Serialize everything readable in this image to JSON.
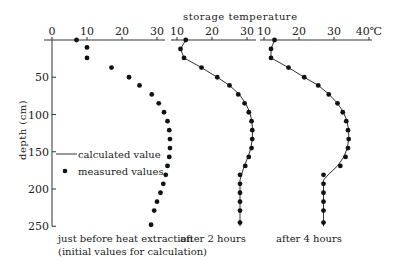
{
  "chart_data": {
    "type": "line",
    "title": "",
    "xlabel": "storage temperature",
    "x_unit": "℃",
    "ylabel": "depth (cm)",
    "ylim": [
      0,
      250
    ],
    "yticks": [
      50,
      100,
      150,
      200,
      250
    ],
    "ytick_labels": [
      "50",
      "100",
      "150",
      "200",
      "250"
    ],
    "grid": false,
    "legend": {
      "position": "left-middle",
      "entries": [
        {
          "label": "calculated value",
          "marker": "line"
        },
        {
          "label": "measured values",
          "marker": "dot"
        }
      ]
    },
    "panels": [
      {
        "caption_lines": [
          "just before heat extraction",
          "(initial values for calculation)"
        ],
        "xlim": [
          0,
          30
        ],
        "xticks": [
          0,
          10,
          20,
          30
        ],
        "xtick_labels": [
          "0",
          "10",
          "20",
          "30"
        ],
        "measured": [
          {
            "t": 7,
            "d": 0
          },
          {
            "t": 10,
            "d": 10
          },
          {
            "t": 10,
            "d": 24
          },
          {
            "t": 17,
            "d": 37
          },
          {
            "t": 22,
            "d": 50
          },
          {
            "t": 25,
            "d": 61
          },
          {
            "t": 28.5,
            "d": 73
          },
          {
            "t": 30.5,
            "d": 85
          },
          {
            "t": 32,
            "d": 97
          },
          {
            "t": 33,
            "d": 109
          },
          {
            "t": 33.5,
            "d": 121
          },
          {
            "t": 33.7,
            "d": 133
          },
          {
            "t": 33.7,
            "d": 145
          },
          {
            "t": 33.5,
            "d": 157
          },
          {
            "t": 33,
            "d": 169
          },
          {
            "t": 32.5,
            "d": 181
          },
          {
            "t": 31.8,
            "d": 193
          },
          {
            "t": 31,
            "d": 205
          },
          {
            "t": 30,
            "d": 217
          },
          {
            "t": 29.2,
            "d": 229
          },
          {
            "t": 28.3,
            "d": 248
          }
        ],
        "calculated": []
      },
      {
        "caption_lines": [
          "after 2 hours"
        ],
        "xlim": [
          10,
          30
        ],
        "xticks": [
          10,
          20,
          30
        ],
        "xtick_labels": [
          "10",
          "20",
          "30"
        ],
        "measured": [
          {
            "t": 12.5,
            "d": 0
          },
          {
            "t": 11,
            "d": 12
          },
          {
            "t": 12,
            "d": 24
          },
          {
            "t": 17,
            "d": 37
          },
          {
            "t": 21.5,
            "d": 50
          },
          {
            "t": 25,
            "d": 61
          },
          {
            "t": 27.5,
            "d": 73
          },
          {
            "t": 29.3,
            "d": 85
          },
          {
            "t": 30.5,
            "d": 97
          },
          {
            "t": 31.3,
            "d": 109
          },
          {
            "t": 31.5,
            "d": 121
          },
          {
            "t": 31.5,
            "d": 133
          },
          {
            "t": 31.3,
            "d": 145
          },
          {
            "t": 30.5,
            "d": 157
          },
          {
            "t": 29.5,
            "d": 169
          },
          {
            "t": 28,
            "d": 181
          },
          {
            "t": 28,
            "d": 193
          },
          {
            "t": 28,
            "d": 205
          },
          {
            "t": 28,
            "d": 217
          },
          {
            "t": 28,
            "d": 229
          },
          {
            "t": 28,
            "d": 245
          }
        ],
        "calculated": [
          {
            "t": 12.5,
            "d": 0
          },
          {
            "t": 11,
            "d": 12
          },
          {
            "t": 12,
            "d": 24
          },
          {
            "t": 17,
            "d": 37
          },
          {
            "t": 21.5,
            "d": 50
          },
          {
            "t": 25,
            "d": 61
          },
          {
            "t": 27.8,
            "d": 73
          },
          {
            "t": 29.6,
            "d": 85
          },
          {
            "t": 30.8,
            "d": 97
          },
          {
            "t": 31.4,
            "d": 109
          },
          {
            "t": 31.6,
            "d": 121
          },
          {
            "t": 31.5,
            "d": 133
          },
          {
            "t": 31.1,
            "d": 145
          },
          {
            "t": 30.3,
            "d": 157
          },
          {
            "t": 29.2,
            "d": 169
          },
          {
            "t": 28,
            "d": 188
          },
          {
            "t": 28,
            "d": 250
          }
        ]
      },
      {
        "caption_lines": [
          "after 4 hours"
        ],
        "xlim": [
          10,
          40
        ],
        "xticks": [
          10,
          20,
          30,
          40
        ],
        "xtick_labels": [
          "10",
          "20",
          "30",
          "40℃"
        ],
        "measured": [
          {
            "t": 13,
            "d": 0
          },
          {
            "t": 12,
            "d": 12
          },
          {
            "t": 12,
            "d": 24
          },
          {
            "t": 17,
            "d": 37
          },
          {
            "t": 21.5,
            "d": 50
          },
          {
            "t": 25.5,
            "d": 61
          },
          {
            "t": 28.5,
            "d": 73
          },
          {
            "t": 31,
            "d": 85
          },
          {
            "t": 32.5,
            "d": 97
          },
          {
            "t": 33.5,
            "d": 109
          },
          {
            "t": 34,
            "d": 121
          },
          {
            "t": 34.2,
            "d": 133
          },
          {
            "t": 34,
            "d": 145
          },
          {
            "t": 33.3,
            "d": 157
          },
          {
            "t": 31.8,
            "d": 169
          },
          {
            "t": 27,
            "d": 181
          },
          {
            "t": 27,
            "d": 193
          },
          {
            "t": 27,
            "d": 205
          },
          {
            "t": 27,
            "d": 217
          },
          {
            "t": 27,
            "d": 229
          },
          {
            "t": 27,
            "d": 245
          }
        ],
        "calculated": [
          {
            "t": 13,
            "d": 0
          },
          {
            "t": 12,
            "d": 12
          },
          {
            "t": 12,
            "d": 24
          },
          {
            "t": 17,
            "d": 37
          },
          {
            "t": 21.5,
            "d": 50
          },
          {
            "t": 25.5,
            "d": 61
          },
          {
            "t": 28.6,
            "d": 73
          },
          {
            "t": 31,
            "d": 85
          },
          {
            "t": 32.7,
            "d": 97
          },
          {
            "t": 33.7,
            "d": 109
          },
          {
            "t": 34.2,
            "d": 121
          },
          {
            "t": 34.2,
            "d": 133
          },
          {
            "t": 33.8,
            "d": 145
          },
          {
            "t": 32.8,
            "d": 157
          },
          {
            "t": 31,
            "d": 169
          },
          {
            "t": 28.5,
            "d": 180
          },
          {
            "t": 27,
            "d": 188
          },
          {
            "t": 27,
            "d": 250
          }
        ]
      }
    ]
  }
}
